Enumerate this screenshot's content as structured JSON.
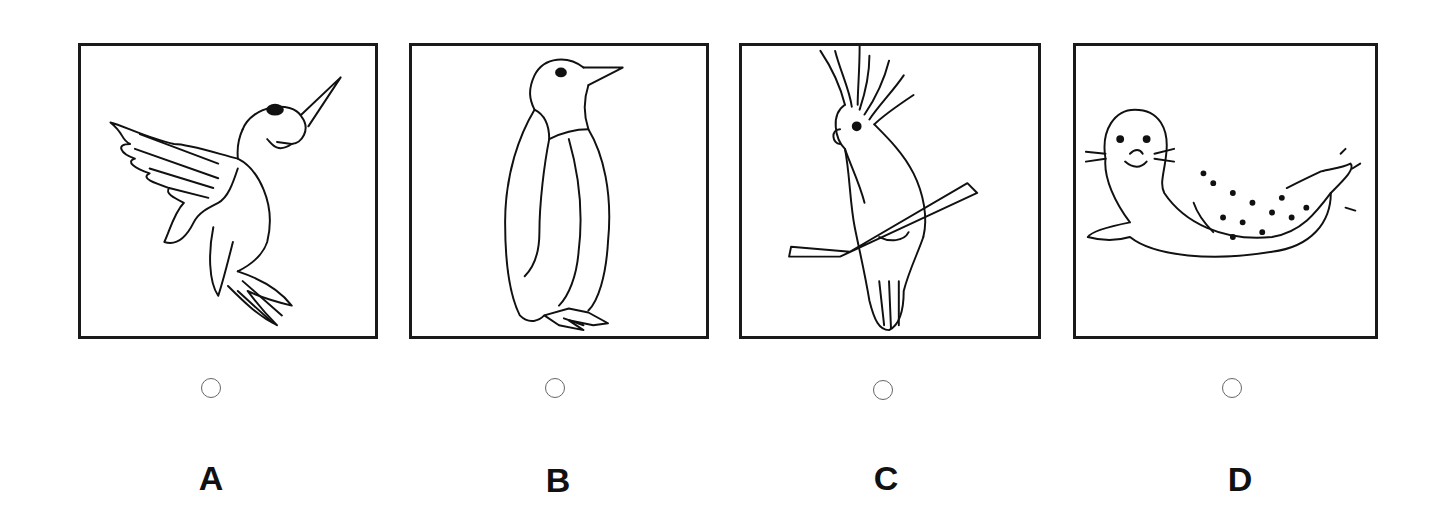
{
  "options": [
    {
      "label": "A",
      "animal": "hummingbird",
      "selected": false
    },
    {
      "label": "B",
      "animal": "penguin",
      "selected": false
    },
    {
      "label": "C",
      "animal": "cockatoo",
      "selected": false
    },
    {
      "label": "D",
      "animal": "seal",
      "selected": false
    }
  ]
}
